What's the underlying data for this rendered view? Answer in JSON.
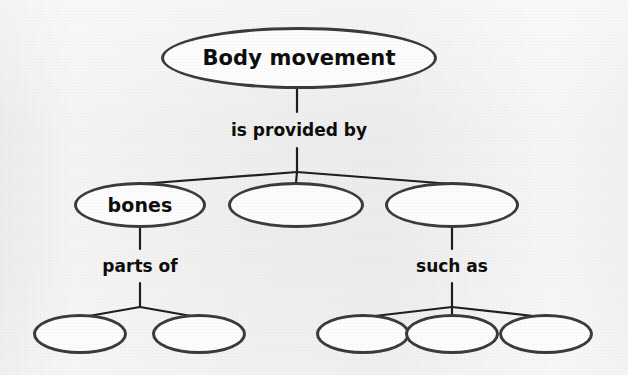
{
  "diagram": {
    "type": "concept-map",
    "colors": {
      "background": "#ededed",
      "node_fill": "#fdfdfd",
      "node_stroke": "#3b3b3b",
      "edge_stroke": "#1f1f1f",
      "text": "#0d0d0d"
    },
    "nodes": [
      {
        "id": "root",
        "label": "Body movement",
        "tier": 1,
        "filled": true,
        "cx": 299,
        "cy": 58,
        "rx": 138,
        "ry": 31
      },
      {
        "id": "n2a",
        "label": "bones",
        "tier": 2,
        "filled": true,
        "cx": 140,
        "cy": 205,
        "rx": 66,
        "ry": 23
      },
      {
        "id": "n2b",
        "label": "",
        "tier": 2,
        "filled": false,
        "cx": 296,
        "cy": 205,
        "rx": 68,
        "ry": 23
      },
      {
        "id": "n2c",
        "label": "",
        "tier": 2,
        "filled": false,
        "cx": 452,
        "cy": 205,
        "rx": 67,
        "ry": 23
      },
      {
        "id": "n3a",
        "label": "",
        "tier": 3,
        "filled": false,
        "cx": 80,
        "cy": 334,
        "rx": 47,
        "ry": 20
      },
      {
        "id": "n3b",
        "label": "",
        "tier": 3,
        "filled": false,
        "cx": 199,
        "cy": 334,
        "rx": 47,
        "ry": 20
      },
      {
        "id": "n3c",
        "label": "",
        "tier": 3,
        "filled": false,
        "cx": 363,
        "cy": 334,
        "rx": 47,
        "ry": 20
      },
      {
        "id": "n3d",
        "label": "",
        "tier": 3,
        "filled": false,
        "cx": 452,
        "cy": 334,
        "rx": 47,
        "ry": 20
      },
      {
        "id": "n3e",
        "label": "",
        "tier": 3,
        "filled": false,
        "cx": 546,
        "cy": 334,
        "rx": 47,
        "ry": 20
      }
    ],
    "link_labels": [
      {
        "id": "l1",
        "text": "is provided by",
        "x": 299,
        "y": 130
      },
      {
        "id": "l2",
        "text": "parts of",
        "x": 140,
        "y": 266
      },
      {
        "id": "l3",
        "text": "such as",
        "x": 452,
        "y": 266
      }
    ]
  }
}
